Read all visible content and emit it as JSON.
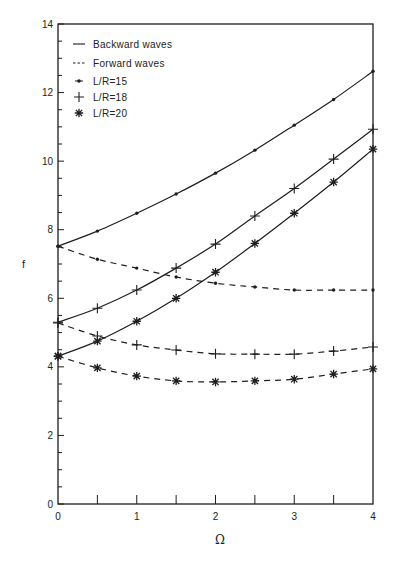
{
  "chart_data": {
    "type": "line",
    "title": "",
    "xlabel": "Ω",
    "ylabel": "f",
    "xlim": [
      0,
      4
    ],
    "ylim": [
      0,
      14
    ],
    "x_ticks": [
      0,
      1,
      2,
      3,
      4
    ],
    "x_tick_labels": [
      "0",
      "1",
      "2",
      "3",
      "4"
    ],
    "x_minor_ticks": [
      0.5,
      1.5,
      2.5,
      3.5
    ],
    "y_ticks": [
      0,
      2,
      4,
      6,
      8,
      10,
      12,
      14
    ],
    "y_tick_labels": [
      "0",
      "2",
      "4",
      "6",
      "8",
      "10",
      "12",
      "14"
    ],
    "grid": false,
    "legend_position": "upper left",
    "legend": [
      {
        "label": "Backward waves",
        "marker": "line-solid"
      },
      {
        "label": "Forward waves",
        "marker": "line-dashed"
      },
      {
        "label": "L/R=15",
        "marker": "dot"
      },
      {
        "label": "L/R=18",
        "marker": "plus"
      },
      {
        "label": "L/R=20",
        "marker": "asterisk"
      }
    ],
    "x": [
      0,
      0.5,
      1,
      1.5,
      2,
      2.5,
      3,
      3.5,
      4
    ],
    "series": [
      {
        "name": "L/R=15 Backward waves",
        "style": "solid",
        "marker": "dot",
        "values": [
          7.52,
          7.96,
          8.48,
          9.04,
          9.65,
          10.32,
          11.05,
          11.8,
          12.62
        ]
      },
      {
        "name": "L/R=15 Forward waves",
        "style": "dashed",
        "marker": "dot",
        "values": [
          7.52,
          7.14,
          6.88,
          6.62,
          6.44,
          6.33,
          6.24,
          6.24,
          6.24
        ]
      },
      {
        "name": "L/R=18 Backward waves",
        "style": "solid",
        "marker": "plus",
        "values": [
          5.3,
          5.71,
          6.24,
          6.88,
          7.58,
          8.4,
          9.2,
          10.06,
          10.93
        ]
      },
      {
        "name": "L/R=18 Forward waves",
        "style": "dashed",
        "marker": "plus",
        "values": [
          5.28,
          4.9,
          4.64,
          4.49,
          4.38,
          4.37,
          4.37,
          4.46,
          4.58
        ]
      },
      {
        "name": "L/R=20 Backward waves",
        "style": "solid",
        "marker": "asterisk",
        "values": [
          4.31,
          4.75,
          5.33,
          6.0,
          6.76,
          7.6,
          8.48,
          9.39,
          10.35
        ]
      },
      {
        "name": "L/R=20 Forward waves",
        "style": "dashed",
        "marker": "asterisk",
        "values": [
          4.31,
          3.97,
          3.73,
          3.59,
          3.56,
          3.59,
          3.64,
          3.79,
          3.94
        ]
      }
    ],
    "colors": {
      "ink": "#1e1e1e",
      "background": "#ffffff"
    }
  }
}
